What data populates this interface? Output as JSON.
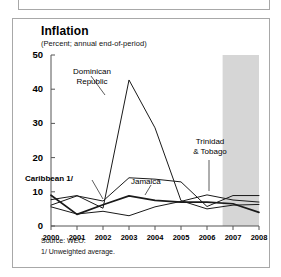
{
  "panel": {
    "title": "Inflation",
    "subtitle": "(Percent; annual end-of-period)",
    "source_note": "Source: WEO.",
    "footnote": "1/ Unweighted average."
  },
  "colors": {
    "line": "#1a1a1a",
    "projection_band": "#d6d6d6",
    "axis": "#555555",
    "panel_border": "#a8a8a8",
    "background": "#ffffff"
  },
  "annotations": {
    "dominican_republic": "Dominican\nRepublic",
    "dominican_republic_line1": "Dominican",
    "dominican_republic_line2": "Republic",
    "caribbean": "Caribbean 1/",
    "jamaica": "Jamaica",
    "trinidad_line1": "Trinidad",
    "trinidad_line2": "& Tobago"
  },
  "chart_data": {
    "type": "line",
    "title": "Inflation",
    "subtitle": "(Percent; annual end-of-period)",
    "xlabel": "",
    "ylabel": "",
    "xlim": [
      2000,
      2008
    ],
    "ylim": [
      0,
      50
    ],
    "yticks": [
      0,
      10,
      20,
      30,
      40,
      50
    ],
    "xticks": [
      2000,
      2001,
      2002,
      2003,
      2004,
      2005,
      2006,
      2007,
      2008
    ],
    "xtick_labels": [
      "2000",
      "2001",
      "2002",
      "2003",
      "2004",
      "2005",
      "2006",
      "2007",
      "2008"
    ],
    "grid": false,
    "legend": "inline-annotations",
    "projection_band": {
      "label": "projection",
      "x_start": 2006.6,
      "x_end": 2008.4,
      "shaded": true
    },
    "x": [
      2000,
      2001,
      2002,
      2003,
      2004,
      2005,
      2006,
      2007,
      2008
    ],
    "series": [
      {
        "name": "Dominican Republic",
        "values": [
          7.7,
          8.9,
          5.2,
          42.7,
          28.7,
          7.4,
          5.0,
          6.1,
          6.3
        ]
      },
      {
        "name": "Jamaica",
        "values": [
          6.1,
          8.8,
          7.3,
          14.1,
          13.7,
          12.9,
          5.7,
          8.9,
          8.9
        ]
      },
      {
        "name": "Caribbean 1/",
        "values": [
          9.0,
          3.4,
          6.2,
          8.8,
          7.5,
          7.0,
          7.0,
          6.5,
          4.0
        ]
      },
      {
        "name": "Trinidad & Tobago",
        "values": [
          5.6,
          3.5,
          4.3,
          3.0,
          5.6,
          7.2,
          9.1,
          7.6,
          7.0
        ]
      }
    ]
  }
}
